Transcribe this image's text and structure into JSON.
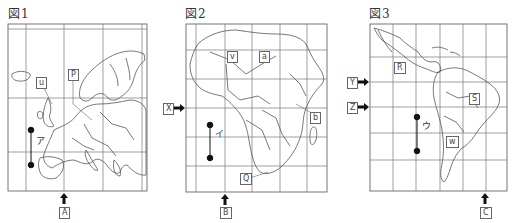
{
  "figures": [
    {
      "title": "図1",
      "region": "Europe",
      "scale_bar_label": "ア",
      "meridian_arrow_label": "A",
      "box_labels": [
        "P",
        "u"
      ]
    },
    {
      "title": "図2",
      "region": "Africa",
      "scale_bar_label": "イ",
      "meridian_arrow_label": "B",
      "parallel_arrow_label": "X",
      "box_labels": [
        "v",
        "a",
        "b",
        "Q"
      ]
    },
    {
      "title": "図3",
      "region": "Latin America",
      "scale_bar_label": "ウ",
      "meridian_arrow_label": "C",
      "parallel_arrow_labels": [
        "Y",
        "Z"
      ],
      "box_labels": [
        "R",
        "S",
        "w"
      ]
    }
  ],
  "colors": {
    "line": "#555555",
    "grid": "#777777",
    "arrow": "#111111"
  }
}
